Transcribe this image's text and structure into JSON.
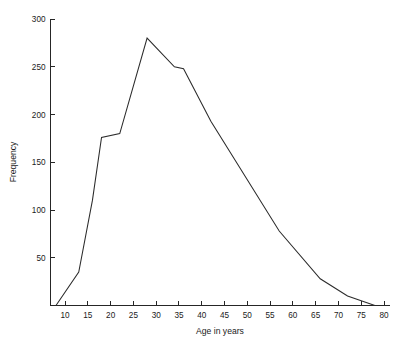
{
  "chart_data": {
    "type": "line",
    "title": "",
    "subtitle": "",
    "xlabel": "Age in years",
    "ylabel": "Frequency",
    "xlim": [
      5,
      80
    ],
    "ylim": [
      0,
      300
    ],
    "grid": false,
    "legend": null,
    "legend_position": "none",
    "line_color": "#2b2b2b",
    "background_color": "#ffffff",
    "axis_color": "#262626",
    "xticks": [
      10,
      15,
      20,
      25,
      30,
      35,
      40,
      45,
      50,
      55,
      60,
      65,
      70,
      75,
      80
    ],
    "xtick_labels": [
      "10",
      "15",
      "20",
      "25",
      "30",
      "35",
      "40",
      "45",
      "50",
      "55",
      "60",
      "65",
      "70",
      "75",
      "80"
    ],
    "yticks": [
      0,
      50,
      100,
      150,
      200,
      250,
      300
    ],
    "ytick_labels": [
      "",
      "50",
      "100",
      "150",
      "200",
      "250",
      "300"
    ],
    "series": [
      {
        "name": "Frequency by age",
        "x": [
          8,
          13,
          16,
          18,
          22,
          28,
          34,
          36,
          42,
          57,
          66,
          72,
          78
        ],
        "values": [
          0,
          35,
          110,
          176,
          180,
          280,
          250,
          248,
          193,
          78,
          28,
          10,
          0
        ]
      }
    ],
    "annotations": [],
    "peak": {
      "x": 28,
      "y": 280
    }
  },
  "figure": {
    "width": 404,
    "height": 347
  }
}
